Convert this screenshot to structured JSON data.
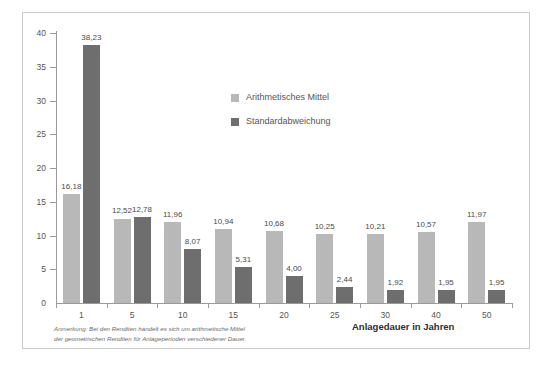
{
  "chart_data": {
    "type": "bar",
    "title": "",
    "subtitle": "",
    "xlabel": "Anlagedauer in Jahren",
    "ylabel": "",
    "categories": [
      "1",
      "5",
      "10",
      "15",
      "20",
      "25",
      "30",
      "40",
      "50"
    ],
    "series": [
      {
        "name": "Arithmetisches Mittel",
        "color": "#b8b8b8",
        "values": [
          16.18,
          12.52,
          11.96,
          10.94,
          10.68,
          10.25,
          10.21,
          10.57,
          11.97
        ],
        "labels": [
          "16,18",
          "12,52",
          "11,96",
          "10,94",
          "10,68",
          "10,25",
          "10,21",
          "10,57",
          "11,97"
        ]
      },
      {
        "name": "Standardabweichung",
        "color": "#6e6e6e",
        "values": [
          38.23,
          12.78,
          8.07,
          5.31,
          4.0,
          2.44,
          1.92,
          1.95,
          1.95
        ],
        "labels": [
          "38,23",
          "12,78",
          "8,07",
          "5,31",
          "4,00",
          "2,44",
          "1,92",
          "1,95",
          "1,95"
        ]
      }
    ],
    "ylim": [
      0,
      40
    ],
    "yticks": [
      0,
      5,
      10,
      15,
      20,
      25,
      30,
      35,
      40
    ],
    "ytick_labels": [
      "0",
      "5",
      "10",
      "15",
      "20",
      "25",
      "30",
      "35",
      "40"
    ],
    "grid": false,
    "legend_position": "upper-center"
  },
  "legend": {
    "items": [
      {
        "label": "Arithmetisches Mittel",
        "color": "#b8b8b8"
      },
      {
        "label": "Standardabweichung",
        "color": "#6e6e6e"
      }
    ]
  },
  "footnote": {
    "line1": "Anmerkung: Bei den Renditen handelt es sich um arithmetische Mittel",
    "line2": "der geometrischen Renditen für Anlageperioden verschiedener Dauer."
  },
  "axis": {
    "x_title": "Anlagedauer in Jahren"
  },
  "caption": {
    "text": ""
  }
}
